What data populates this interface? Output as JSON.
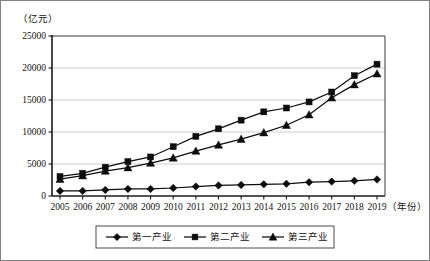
{
  "chart_data": {
    "type": "line",
    "title": "",
    "xlabel": "（年份）",
    "ylabel": "（亿元）",
    "x": [
      2005,
      2006,
      2007,
      2008,
      2009,
      2010,
      2011,
      2012,
      2013,
      2014,
      2015,
      2016,
      2017,
      2018,
      2019
    ],
    "categories": [
      "2005",
      "2006",
      "2007",
      "2008",
      "2009",
      "2010",
      "2011",
      "2012",
      "2013",
      "2014",
      "2015",
      "2016",
      "2017",
      "2018",
      "2019"
    ],
    "ylim": [
      0,
      25000
    ],
    "yticks": [
      0,
      5000,
      10000,
      15000,
      20000,
      25000
    ],
    "ytick_labels": [
      "0",
      "5000",
      "10000",
      "15000",
      "20000",
      "25000"
    ],
    "grid": true,
    "legend_position": "bottom",
    "series": [
      {
        "name": "第一产业",
        "marker": "diamond",
        "color": "#0d0d0d",
        "values": [
          800,
          800,
          950,
          1100,
          1100,
          1250,
          1480,
          1650,
          1720,
          1820,
          1900,
          2150,
          2250,
          2380,
          2580
        ]
      },
      {
        "name": "第二产业",
        "marker": "square",
        "color": "#0d0d0d",
        "values": [
          3050,
          3550,
          4500,
          5380,
          6100,
          7700,
          9320,
          10500,
          11850,
          13150,
          13750,
          14700,
          16250,
          18800,
          20600
        ]
      },
      {
        "name": "第三产业",
        "marker": "triangle",
        "color": "#0d0d0d",
        "values": [
          2620,
          3180,
          3900,
          4430,
          5150,
          5950,
          7020,
          7980,
          8880,
          9900,
          11050,
          12700,
          15350,
          17400,
          19100
        ]
      }
    ]
  },
  "legend": {
    "items": [
      {
        "label": "第一产业",
        "marker": "diamond"
      },
      {
        "label": "第二产業_placeholder",
        "marker": "square"
      },
      {
        "label": "第三产业",
        "marker": "triangle"
      }
    ]
  }
}
